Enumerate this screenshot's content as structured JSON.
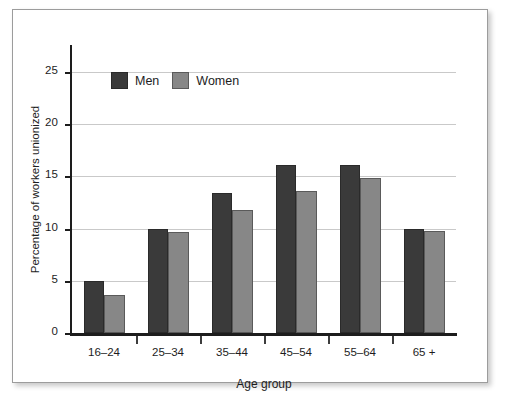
{
  "chart_data": {
    "type": "bar",
    "title": "",
    "subtitle": "",
    "xlabel": "Age group",
    "ylabel": "Percentage of workers unionized",
    "categories": [
      "16–24",
      "25–34",
      "35–44",
      "45–54",
      "55–64",
      "65 +"
    ],
    "series": [
      {
        "name": "Men",
        "color": "#3a3a3a",
        "values": [
          5.0,
          10.0,
          13.4,
          16.1,
          16.1,
          10.0
        ]
      },
      {
        "name": "Women",
        "color": "#878787",
        "values": [
          3.6,
          9.7,
          11.8,
          13.6,
          14.9,
          9.8
        ]
      }
    ],
    "ylim": [
      0,
      27.5
    ],
    "yticks": [
      0,
      5,
      10,
      15,
      20,
      25
    ],
    "ytick_labels": [
      "0",
      "5",
      "10",
      "15",
      "20",
      "25"
    ],
    "grid": "horizontal",
    "legend_position": "upper-left-inside",
    "annotations": []
  },
  "legend": {
    "items": [
      {
        "label": "Men",
        "swatch": "men-swatch"
      },
      {
        "label": "Women",
        "swatch": "women-swatch"
      }
    ]
  },
  "colors": {
    "men_bar": "#3a3a3a",
    "women_bar": "#878787",
    "gridline": "#c9c9c9",
    "axis": "#1d1d1d",
    "frame": "#9c9c9c",
    "background": "#ffffff"
  }
}
